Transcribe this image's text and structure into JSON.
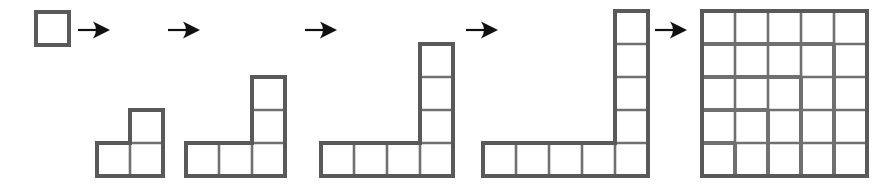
{
  "diagram": {
    "canvas": {
      "width": 885,
      "height": 184
    },
    "colors": {
      "background": "#ffffff",
      "cell_fill": "#ffffff",
      "outline": "#595959",
      "inner_line": "#707070",
      "arrow": "#111111"
    },
    "geometry": {
      "cell_size": 33,
      "baseline_y": 176,
      "outer_stroke_width": 4,
      "inner_stroke_width": 2.6
    },
    "figures": [
      {
        "name": "figure-1",
        "label": "1",
        "shape": "single-square",
        "order": 1,
        "cell_count": 1,
        "gnomon_value": 1,
        "running_total": 1,
        "square_side": 1,
        "origin_x": 36,
        "origin_y": 12,
        "cell": 33,
        "arm_across": 1,
        "arm_up": 0,
        "cells": [
          [
            0,
            0
          ]
        ]
      },
      {
        "name": "figure-2",
        "label": "3",
        "shape": "gnomon",
        "order": 2,
        "cell_count": 3,
        "gnomon_value": 3,
        "running_total": 4,
        "square_side": 2,
        "origin_x": 97,
        "origin_y": 110,
        "cell": 33,
        "arm_across": 2,
        "arm_up": 1,
        "cells": [
          [
            0,
            0
          ],
          [
            1,
            0
          ],
          [
            1,
            1
          ]
        ]
      },
      {
        "name": "figure-3",
        "label": "5",
        "shape": "gnomon",
        "order": 3,
        "cell_count": 5,
        "gnomon_value": 5,
        "running_total": 9,
        "square_side": 3,
        "origin_x": 186,
        "origin_y": 77,
        "cell": 33,
        "arm_across": 3,
        "arm_up": 2,
        "cells": [
          [
            0,
            0
          ],
          [
            1,
            0
          ],
          [
            2,
            0
          ],
          [
            2,
            1
          ],
          [
            2,
            2
          ]
        ]
      },
      {
        "name": "figure-4",
        "label": "7",
        "shape": "gnomon",
        "order": 4,
        "cell_count": 7,
        "gnomon_value": 7,
        "running_total": 16,
        "square_side": 4,
        "origin_x": 321,
        "origin_y": 44,
        "cell": 33,
        "arm_across": 4,
        "arm_up": 3,
        "cells": [
          [
            0,
            0
          ],
          [
            1,
            0
          ],
          [
            2,
            0
          ],
          [
            3,
            0
          ],
          [
            3,
            1
          ],
          [
            3,
            2
          ],
          [
            3,
            3
          ]
        ]
      },
      {
        "name": "figure-5",
        "label": "9",
        "shape": "gnomon",
        "order": 5,
        "cell_count": 9,
        "gnomon_value": 9,
        "running_total": 25,
        "square_side": 5,
        "origin_x": 483,
        "origin_y": 11,
        "cell": 33,
        "arm_across": 5,
        "arm_up": 4,
        "cells": [
          [
            0,
            0
          ],
          [
            1,
            0
          ],
          [
            2,
            0
          ],
          [
            3,
            0
          ],
          [
            4,
            0
          ],
          [
            4,
            1
          ],
          [
            4,
            2
          ],
          [
            4,
            3
          ],
          [
            4,
            4
          ]
        ]
      },
      {
        "name": "figure-6",
        "label": "25",
        "shape": "full-square",
        "order": 6,
        "cell_count": 25,
        "gnomon_value": 0,
        "running_total": 25,
        "square_side": 5,
        "origin_x": 702,
        "origin_y": 11,
        "cell": 33,
        "arm_across": 5,
        "arm_up": 5,
        "nested_gnomons": [
          1,
          3,
          5,
          7,
          9
        ]
      }
    ],
    "arrows": [
      {
        "name": "arrow-1",
        "from": "figure-1",
        "to": "figure-2",
        "x": 78,
        "y": 30,
        "length": 32
      },
      {
        "name": "arrow-2",
        "from": "figure-2",
        "to": "figure-3",
        "x": 168,
        "y": 30,
        "length": 32
      },
      {
        "name": "arrow-3",
        "from": "figure-3",
        "to": "figure-4",
        "x": 305,
        "y": 30,
        "length": 32
      },
      {
        "name": "arrow-4",
        "from": "figure-4",
        "to": "figure-5",
        "x": 466,
        "y": 30,
        "length": 32
      },
      {
        "name": "arrow-5",
        "from": "figure-5",
        "to": "figure-6",
        "x": 655,
        "y": 30,
        "length": 32
      }
    ]
  }
}
